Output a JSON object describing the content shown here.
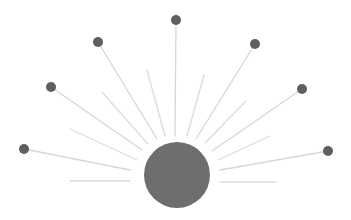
{
  "diagram": {
    "type": "sunburst-hub",
    "width": 351,
    "height": 220,
    "colors": {
      "background": "#ffffff",
      "hub": "#6e6e6e",
      "node": "#5f5f5f",
      "spoke": "#d6d6d6",
      "ray": "#dcdcdc"
    },
    "hub": {
      "cx": 177,
      "cy": 175,
      "r": 33
    },
    "spokes_with_nodes": [
      {
        "id": "far-left",
        "node": [
          24,
          149
        ],
        "end": [
          130,
          170
        ]
      },
      {
        "id": "left",
        "node": [
          51,
          87
        ],
        "end": [
          142,
          150
        ]
      },
      {
        "id": "upper-left",
        "node": [
          98,
          42
        ],
        "end": [
          157,
          139
        ]
      },
      {
        "id": "top",
        "node": [
          176,
          20
        ],
        "end": [
          175,
          136
        ]
      },
      {
        "id": "upper-right",
        "node": [
          255,
          44
        ],
        "end": [
          196,
          139
        ]
      },
      {
        "id": "right",
        "node": [
          302,
          89
        ],
        "end": [
          212,
          151
        ]
      },
      {
        "id": "far-right",
        "node": [
          328,
          151
        ],
        "end": [
          220,
          170
        ]
      }
    ],
    "node_radius": 5,
    "short_rays": [
      {
        "id": "ray-l4",
        "from": [
          70,
          181
        ],
        "to": [
          130,
          181
        ]
      },
      {
        "id": "ray-l3",
        "from": [
          70,
          129
        ],
        "to": [
          137,
          160
        ]
      },
      {
        "id": "ray-l2",
        "from": [
          102,
          92
        ],
        "to": [
          148,
          144
        ]
      },
      {
        "id": "ray-l1",
        "from": [
          147,
          70
        ],
        "to": [
          165,
          136
        ]
      },
      {
        "id": "ray-r1",
        "from": [
          204,
          75
        ],
        "to": [
          187,
          136
        ]
      },
      {
        "id": "ray-r2",
        "from": [
          246,
          101
        ],
        "to": [
          205,
          143
        ]
      },
      {
        "id": "ray-r3",
        "from": [
          270,
          136
        ],
        "to": [
          218,
          160
        ]
      },
      {
        "id": "ray-r4",
        "from": [
          220,
          182
        ],
        "to": [
          276,
          182
        ]
      }
    ]
  }
}
